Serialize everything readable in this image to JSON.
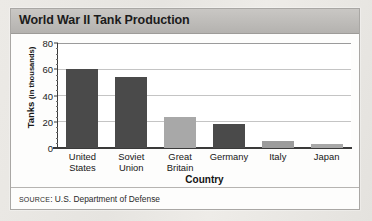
{
  "title": "World War II Tank Production",
  "source": {
    "prefix": "SOURCE",
    "separator": ": ",
    "text": "U.S. Department of Defense",
    "full": "SOURCE: U.S. Department of Defense"
  },
  "colors": {
    "bar_dark": "#4a4a4a",
    "bar_light": "#a8a8a8",
    "gridline": "#c4c4c4",
    "axis": "#3a3a3a",
    "title_bar_top": "#c9c7c4",
    "title_bar_bottom": "#b4b2af",
    "panel_bg": "#fdfdfc",
    "page_bg": "#e9e7e3"
  },
  "chart_data": {
    "type": "bar",
    "title": "World War II Tank Production",
    "xlabel": "Country",
    "ylabel": "Tanks (in thousands)",
    "ylabel_main": "Tanks",
    "ylabel_unit": "(in thousands)",
    "categories": [
      "United States",
      "Soviet Union",
      "Great Britain",
      "Germany",
      "Italy",
      "Japan"
    ],
    "category_lines": [
      [
        "United",
        "States"
      ],
      [
        "Soviet",
        "Union"
      ],
      [
        "Great",
        "Britain"
      ],
      [
        "Germany"
      ],
      [
        "Italy"
      ],
      [
        "Japan"
      ]
    ],
    "values": [
      60,
      54,
      24,
      18,
      5,
      3
    ],
    "bar_colors": [
      "#4a4a4a",
      "#4a4a4a",
      "#a8a8a8",
      "#4a4a4a",
      "#9c9c9c",
      "#a8a8a8"
    ],
    "ylim": [
      0,
      80
    ],
    "yticks": [
      0,
      20,
      40,
      60,
      80
    ],
    "ytick_labels": [
      "0",
      "20",
      "40",
      "60",
      "80"
    ],
    "minor_tick_step": 4,
    "grid": true,
    "legend": false
  }
}
